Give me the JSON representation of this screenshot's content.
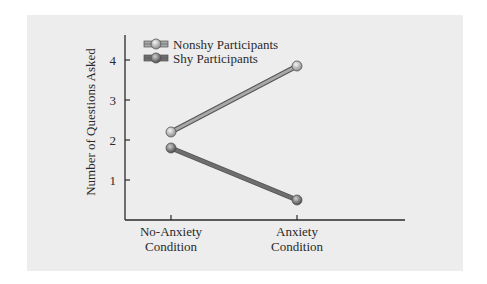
{
  "chart_data": {
    "type": "line",
    "title": "",
    "xlabel": "",
    "ylabel": "Number of Questions Asked",
    "categories": [
      "No-Anxiety Condition",
      "Anxiety Condition"
    ],
    "category_lines": [
      [
        "No-Anxiety",
        "Condition"
      ],
      [
        "Anxiety",
        "Condition"
      ]
    ],
    "series": [
      {
        "name": "Nonshy Participants",
        "values": [
          2.2,
          3.85
        ],
        "color": "#a8a8a8"
      },
      {
        "name": "Shy Participants",
        "values": [
          1.8,
          0.5
        ],
        "color": "#6e6e6e"
      }
    ],
    "yticks": [
      1,
      2,
      3,
      4
    ],
    "ylim": [
      0,
      4.5
    ],
    "grid": false,
    "legend_position": "top-left"
  },
  "colors": {
    "panel_bg": "#ededed",
    "axis": "#2a2a2a"
  }
}
